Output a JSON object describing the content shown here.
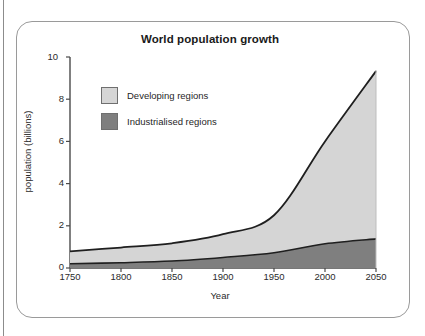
{
  "figure": {
    "title": "World population growth"
  },
  "chart_data": {
    "type": "area",
    "title": "World population growth",
    "xlabel": "Year",
    "ylabel": "population (billions)",
    "xlim": [
      1750,
      2050
    ],
    "ylim": [
      0,
      10
    ],
    "grid": false,
    "stacked": true,
    "legend_position": "upper-left-inside",
    "x_ticks": [
      "1750",
      "1800",
      "1850",
      "1900",
      "1950",
      "2000",
      "2050"
    ],
    "y_ticks": [
      "0",
      "2",
      "4",
      "6",
      "8",
      "10"
    ],
    "x": [
      1750,
      1800,
      1850,
      1900,
      1950,
      2000,
      2050
    ],
    "series": [
      {
        "name": "Industrialised regions",
        "color": "#7f7f7f",
        "values": [
          0.2,
          0.25,
          0.33,
          0.5,
          0.72,
          1.15,
          1.38
        ]
      },
      {
        "name": "Developing regions",
        "color": "#d5d5d5",
        "values": [
          0.59,
          0.72,
          0.84,
          1.1,
          1.78,
          4.85,
          7.95
        ]
      }
    ],
    "totals": [
      0.79,
      0.97,
      1.17,
      1.6,
      2.5,
      6.0,
      9.33
    ]
  },
  "legend": {
    "items": [
      {
        "label": "Developing regions",
        "swatch": "#d5d5d5"
      },
      {
        "label": "Industrialised regions",
        "swatch": "#7f7f7f"
      }
    ]
  },
  "axes": {
    "y_title": "population (billions)",
    "x_title": "Year",
    "y_ticks": [
      "10",
      "8",
      "6",
      "4",
      "2",
      "0"
    ],
    "x_ticks": [
      "1750",
      "1800",
      "1850",
      "1900",
      "1950",
      "2000",
      "2050"
    ]
  }
}
